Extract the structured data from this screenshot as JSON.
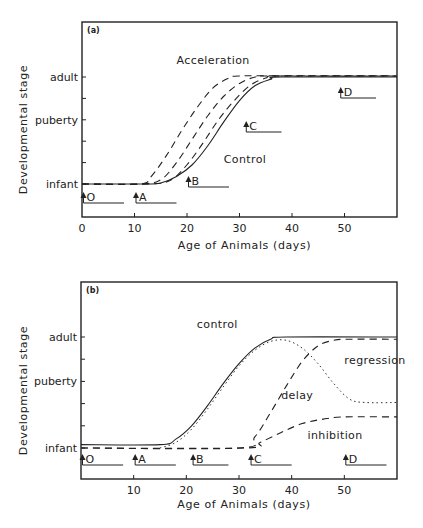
{
  "chart_data": [
    {
      "panel": "(a)",
      "type": "line",
      "title": "",
      "xlabel": "Age of Animals (days)",
      "ylabel": "Developmental stage",
      "xlim": [
        0,
        60
      ],
      "ylim": [
        -1.5,
        6.5
      ],
      "xticks": [
        0,
        10,
        20,
        30,
        40,
        50
      ],
      "ytick_positions": [
        0,
        1,
        2,
        3,
        4,
        5
      ],
      "ytick_labels": {
        "0": "infant",
        "3": "puberty",
        "5": "adult"
      },
      "grid": false,
      "annotations": [
        {
          "text": "Acceleration",
          "x": 18,
          "y": 5.6
        },
        {
          "text": "Control",
          "x": 27,
          "y": 1.0
        }
      ],
      "markers": [
        {
          "label": "O",
          "x": 0,
          "bar_end": 8
        },
        {
          "label": "A",
          "x": 10,
          "bar_end": 18
        },
        {
          "label": "B",
          "x": 20,
          "bar_end": 28
        },
        {
          "label": "C",
          "x": 31,
          "bar_end": 38
        },
        {
          "label": "D",
          "x": 49,
          "bar_end": 56
        }
      ],
      "series": [
        {
          "name": "Control",
          "style": "solid",
          "points": [
            [
              0,
              0
            ],
            [
              12,
              0
            ],
            [
              15,
              0.05
            ],
            [
              18,
              0.35
            ],
            [
              21,
              0.9
            ],
            [
              24,
              1.8
            ],
            [
              27,
              2.9
            ],
            [
              30,
              3.9
            ],
            [
              33,
              4.6
            ],
            [
              36,
              4.9
            ],
            [
              38,
              5
            ],
            [
              60,
              5
            ]
          ]
        },
        {
          "name": "Acceleration 1",
          "style": "dashed",
          "points": [
            [
              0,
              0
            ],
            [
              11,
              0
            ],
            [
              13,
              0.3
            ],
            [
              16,
              1.3
            ],
            [
              19,
              2.5
            ],
            [
              22,
              3.6
            ],
            [
              25,
              4.5
            ],
            [
              28,
              4.95
            ],
            [
              30,
              5.05
            ],
            [
              40,
              5.05
            ],
            [
              60,
              5.05
            ]
          ]
        },
        {
          "name": "Acceleration 2",
          "style": "dashed",
          "points": [
            [
              0,
              0
            ],
            [
              11,
              0
            ],
            [
              15,
              0.2
            ],
            [
              18,
              1.0
            ],
            [
              21,
              2.1
            ],
            [
              24,
              3.2
            ],
            [
              27,
              4.1
            ],
            [
              30,
              4.7
            ],
            [
              33,
              5.0
            ],
            [
              36,
              5.05
            ],
            [
              60,
              5.05
            ]
          ]
        },
        {
          "name": "Acceleration 3",
          "style": "dashed",
          "points": [
            [
              0,
              0
            ],
            [
              13,
              0
            ],
            [
              17,
              0.2
            ],
            [
              20,
              0.9
            ],
            [
              23,
              1.9
            ],
            [
              26,
              3.0
            ],
            [
              29,
              3.9
            ],
            [
              32,
              4.6
            ],
            [
              35,
              4.95
            ],
            [
              38,
              5.05
            ],
            [
              60,
              5.05
            ]
          ]
        }
      ]
    },
    {
      "panel": "(b)",
      "type": "line",
      "title": "",
      "xlabel": "Age of Animals (days)",
      "ylabel": "Developmental stage",
      "xlim": [
        0,
        60
      ],
      "ylim": [
        -1.5,
        6.5
      ],
      "xticks": [
        10,
        20,
        30,
        40,
        50
      ],
      "ytick_positions": [
        0,
        1,
        2,
        3,
        4,
        5
      ],
      "ytick_labels": {
        "0": "infant",
        "3": "puberty",
        "5": "adult"
      },
      "grid": false,
      "annotations": [
        {
          "text": "control",
          "x": 22,
          "y": 5.4
        },
        {
          "text": "regression",
          "x": 50,
          "y": 3.8
        },
        {
          "text": "delay",
          "x": 38,
          "y": 2.2
        },
        {
          "text": "inhibition",
          "x": 43,
          "y": 0.4
        }
      ],
      "markers": [
        {
          "label": "O",
          "x": 0,
          "bar_end": 8
        },
        {
          "label": "A",
          "x": 10,
          "bar_end": 18
        },
        {
          "label": "B",
          "x": 21,
          "bar_end": 28
        },
        {
          "label": "C",
          "x": 32,
          "bar_end": 40
        },
        {
          "label": "D",
          "x": 50,
          "bar_end": 58
        }
      ],
      "series": [
        {
          "name": "control",
          "style": "solid",
          "points": [
            [
              0,
              0.15
            ],
            [
              15,
              0.15
            ],
            [
              18,
              0.4
            ],
            [
              21,
              1.0
            ],
            [
              24,
              1.9
            ],
            [
              27,
              2.9
            ],
            [
              30,
              3.8
            ],
            [
              33,
              4.5
            ],
            [
              36,
              4.9
            ],
            [
              39,
              5.0
            ],
            [
              60,
              5.0
            ]
          ]
        },
        {
          "name": "regression",
          "style": "dotted",
          "points": [
            [
              15,
              0
            ],
            [
              18,
              0.25
            ],
            [
              21,
              0.85
            ],
            [
              24,
              1.75
            ],
            [
              27,
              2.75
            ],
            [
              30,
              3.7
            ],
            [
              33,
              4.4
            ],
            [
              36,
              4.8
            ],
            [
              39,
              4.85
            ],
            [
              42,
              4.5
            ],
            [
              45,
              3.8
            ],
            [
              48,
              2.9
            ],
            [
              51,
              2.2
            ],
            [
              54,
              2.05
            ],
            [
              60,
              2.05
            ]
          ]
        },
        {
          "name": "delay",
          "style": "dashed",
          "points": [
            [
              0,
              0
            ],
            [
              30,
              0
            ],
            [
              33,
              0.5
            ],
            [
              36,
              1.6
            ],
            [
              39,
              2.8
            ],
            [
              42,
              3.9
            ],
            [
              45,
              4.6
            ],
            [
              48,
              4.85
            ],
            [
              51,
              4.9
            ],
            [
              60,
              4.9
            ]
          ]
        },
        {
          "name": "inhibition",
          "style": "dashed",
          "points": [
            [
              0,
              0
            ],
            [
              31,
              0
            ],
            [
              34,
              0.25
            ],
            [
              38,
              0.7
            ],
            [
              42,
              1.1
            ],
            [
              46,
              1.3
            ],
            [
              50,
              1.4
            ],
            [
              60,
              1.4
            ]
          ]
        }
      ]
    }
  ],
  "labels": {
    "panel_a": "(a)",
    "panel_b": "(b)",
    "xlabel": "Age of Animals (days)",
    "ylabel": "Developmental stage",
    "adult": "adult",
    "puberty": "puberty",
    "infant": "infant"
  }
}
